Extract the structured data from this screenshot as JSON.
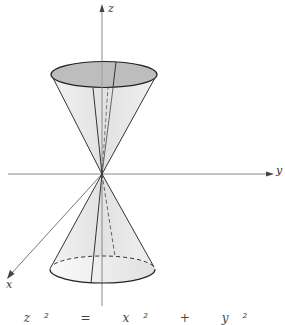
{
  "figure": {
    "axes": {
      "x_label": "x",
      "y_label": "y",
      "z_label": "z"
    },
    "caption_partial": "z² = x² + y²",
    "colors": {
      "line": "#333333",
      "axis": "#777777",
      "cone_fill": "#e6e6e6",
      "top_ellipse_fill": "#bdbdbd",
      "bottom_ellipse_fill": "#ececec"
    }
  }
}
